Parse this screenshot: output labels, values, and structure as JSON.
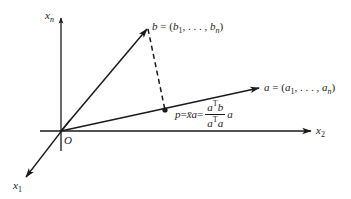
{
  "diagram": {
    "colors": {
      "ink": "#1a1a1a",
      "background": "#ffffff"
    },
    "origin": {
      "label": "O",
      "x": 61,
      "y": 131
    },
    "axes": [
      {
        "id": "x_n",
        "label_base": "x",
        "label_sub": "n",
        "from": [
          61,
          151
        ],
        "to": [
          61,
          16
        ]
      },
      {
        "id": "x_2",
        "label_base": "x",
        "label_sub": "2",
        "from": [
          40,
          131
        ],
        "to": [
          312,
          131
        ]
      },
      {
        "id": "x_1",
        "label_base": "x",
        "label_sub": "1",
        "from": [
          70,
          121
        ],
        "to": [
          25,
          178
        ]
      }
    ],
    "vectors": [
      {
        "id": "b",
        "from": [
          61,
          131
        ],
        "to": [
          148,
          28
        ],
        "label": "b = (b₁, . . . , bₙ)"
      },
      {
        "id": "a",
        "from": [
          61,
          131
        ],
        "to": [
          260,
          88
        ],
        "label": "a = (a₁, . . . , aₙ)"
      }
    ],
    "projection_point": {
      "id": "p",
      "x": 165,
      "y": 110
    },
    "dashed_segment": {
      "from": [
        148,
        28
      ],
      "to": [
        165,
        110
      ]
    },
    "labels": {
      "origin": "O",
      "x_n_base": "x",
      "x_n_sub": "n",
      "x_2_base": "x",
      "x_2_sub": "2",
      "x_1_base": "x",
      "x_1_sub": "1",
      "b_name": "b",
      "b_eq": " = (",
      "b_first": "b",
      "b_first_sub": "1",
      "b_dots": ", . . . , ",
      "b_last": "b",
      "b_last_sub": "n",
      "b_close": ")",
      "a_name": "a",
      "a_eq": " = (",
      "a_first": "a",
      "a_first_sub": "1",
      "a_dots": ", . . . , ",
      "a_last": "a",
      "a_last_sub": "n",
      "a_close": ")",
      "p_name": "p",
      "p_eq1": " = ",
      "p_xbar": "x̄",
      "p_a": "a",
      "p_eq2": " = ",
      "frac_num_a": "a",
      "frac_num_sup": "T",
      "frac_num_b": "b",
      "frac_den_a": "a",
      "frac_den_sup": "T",
      "frac_den_a2": "a",
      "p_tail": " a"
    }
  }
}
